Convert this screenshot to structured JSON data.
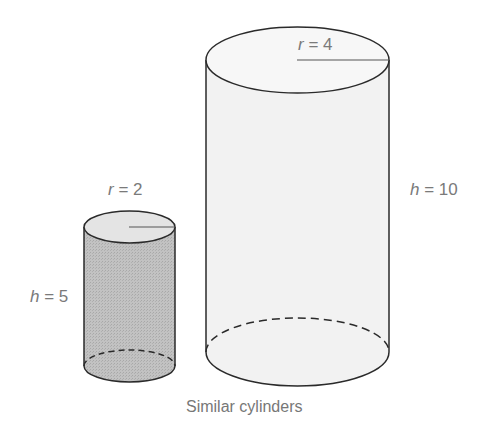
{
  "caption": "Similar cylinders",
  "small_cylinder": {
    "radius_label": {
      "var": "r",
      "eq": " = 2"
    },
    "height_label": {
      "var": "h",
      "eq": " = 5"
    },
    "fill": "#bdbdbd"
  },
  "large_cylinder": {
    "radius_label": {
      "var": "r",
      "eq": " = 4"
    },
    "height_label": {
      "var": "h",
      "eq": " = 10"
    },
    "fill": "#f3f3f3"
  },
  "colors": {
    "stroke": "#2a2a2a",
    "label": "#7a7a7a"
  }
}
